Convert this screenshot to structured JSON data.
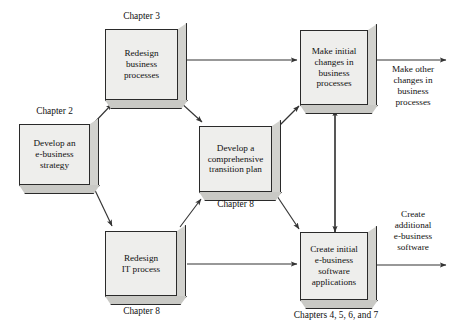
{
  "figure": {
    "type": "flow-diagram",
    "background_color": "#ffffff",
    "node_fill_color": "#eeeeec",
    "node_border_color": "#2a2a2a",
    "arrow_color": "#333333"
  },
  "nodes": [
    {
      "id": "develop-strategy",
      "label": "Develop an\ne-business\nstrategy",
      "caption": "Chapter 2",
      "caption_position": "above"
    },
    {
      "id": "redesign-business-processes",
      "label": "Redesign\nbusiness\nprocesses",
      "caption": "Chapter 3",
      "caption_position": "above"
    },
    {
      "id": "redesign-it-process",
      "label": "Redesign\nIT process",
      "caption": "Chapter 8",
      "caption_position": "below"
    },
    {
      "id": "transition-plan",
      "label": "Develop a\ncomprehensive\ntransition plan",
      "caption": "Chapter 8",
      "caption_position": "below"
    },
    {
      "id": "make-initial-changes",
      "label": "Make initial\nchanges in\nbusiness\nprocesses",
      "caption": "",
      "caption_position": "none"
    },
    {
      "id": "create-initial-software",
      "label": "Create initial\ne-business\nsoftware\napplications",
      "caption": "Chapters 4, 5, 6,  and 7",
      "caption_position": "below"
    }
  ],
  "output_labels": [
    {
      "id": "make-other-changes",
      "text": "Make other\nchanges in\nbusiness\nprocesses"
    },
    {
      "id": "create-additional-software",
      "text": "Create\nadditional\ne-business\nsoftware"
    }
  ],
  "connections": [
    {
      "from": "develop-strategy",
      "to": "redesign-business-processes",
      "style": "single"
    },
    {
      "from": "develop-strategy",
      "to": "redesign-it-process",
      "style": "single"
    },
    {
      "from": "redesign-business-processes",
      "to": "make-initial-changes",
      "style": "single"
    },
    {
      "from": "redesign-business-processes",
      "to": "transition-plan",
      "style": "single"
    },
    {
      "from": "redesign-it-process",
      "to": "transition-plan",
      "style": "single"
    },
    {
      "from": "redesign-it-process",
      "to": "create-initial-software",
      "style": "single"
    },
    {
      "from": "transition-plan",
      "to": "make-initial-changes",
      "style": "single"
    },
    {
      "from": "transition-plan",
      "to": "create-initial-software",
      "style": "single"
    },
    {
      "from": "make-initial-changes",
      "to": "create-initial-software",
      "style": "double"
    },
    {
      "from": "make-initial-changes",
      "to": "make-other-changes",
      "style": "single"
    },
    {
      "from": "create-initial-software",
      "to": "create-additional-software",
      "style": "single"
    }
  ]
}
